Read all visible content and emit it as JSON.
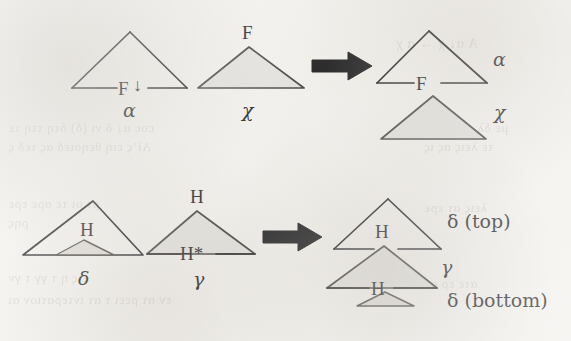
{
  "figure": {
    "kind": "syntactic-tree-triangle-diagram",
    "background_color": "#f2f0ec",
    "ink_color": "#18171a",
    "triangle_fill_color": "#e2e0dc",
    "arrow_color": "#121214",
    "rows": [
      {
        "id": "row-upper",
        "input": {
          "constituents": [
            {
              "id": "alpha-source",
              "filled": false,
              "internal_labels": [
                "F"
              ],
              "internal_label_marker": "downarrow",
              "caption": "α"
            },
            {
              "id": "chi-source",
              "filled": true,
              "apex_labels": [
                "F"
              ],
              "caption": "χ"
            }
          ]
        },
        "operator": "arrow-right",
        "output": {
          "constituents": [
            {
              "id": "alpha-result",
              "filled": false,
              "internal_labels": [
                "F"
              ],
              "side_label": "α"
            },
            {
              "id": "chi-result",
              "filled": true,
              "side_label": "χ"
            }
          ]
        }
      },
      {
        "id": "row-lower",
        "input": {
          "constituents": [
            {
              "id": "delta-source",
              "filled": false,
              "internal_labels": [
                "H"
              ],
              "nested": {
                "id": "delta-source-inner",
                "filled": true
              },
              "caption": "δ"
            },
            {
              "id": "gamma-source",
              "filled": true,
              "apex_labels": [
                "H"
              ],
              "internal_labels": [
                "H*"
              ],
              "caption": "γ"
            }
          ]
        },
        "operator": "arrow-right",
        "output": {
          "constituents": [
            {
              "id": "delta-top-result",
              "filled": false,
              "internal_labels": [
                "H"
              ],
              "side_label": "δ (top)"
            },
            {
              "id": "gamma-result",
              "filled": true,
              "internal_labels": [
                "H"
              ],
              "side_label": "γ"
            },
            {
              "id": "delta-bottom-result",
              "filled": true,
              "side_label": "δ (bottom)"
            }
          ]
        }
      }
    ],
    "labels": {
      "f_upper_left": "F",
      "f_chi_apex": "F",
      "f_result": "F",
      "alpha_caption": "α",
      "chi_caption": "χ",
      "alpha_side": "α",
      "chi_side": "χ",
      "h_delta": "H",
      "h_gamma_apex": "H",
      "h_star_gamma": "H*",
      "delta_caption": "δ",
      "gamma_caption": "γ",
      "h_delta_top_result": "H",
      "h_gamma_result": "H",
      "delta_top_side": "δ (top)",
      "gamma_side": "γ",
      "delta_bottom_side": "δ (bottom)",
      "down_arrow": "↓"
    }
  },
  "bleedthrough": {
    "note": "faint mirrored text showing through from the reverse page",
    "lines": [
      {
        "text": "A  α↓  χ  →  α  χ",
        "x": 396,
        "y": 36,
        "size": 14
      },
      {
        "text": "coc α↓ δ νι (δ) δτη ττη τε",
        "x": 8,
        "y": 120,
        "size": 13
      },
      {
        "text": "Ai’ς ειη θεηοιεδ ας τεδ ς",
        "x": 8,
        "y": 139,
        "size": 13
      },
      {
        "text": "με δλ οι τες δε",
        "x": 424,
        "y": 120,
        "size": 13
      },
      {
        "text": "τε λεις ας ις",
        "x": 424,
        "y": 139,
        "size": 13
      },
      {
        "text": "ρτ οι τε αρε ερε",
        "x": 8,
        "y": 196,
        "size": 13
      },
      {
        "text": "ρης",
        "x": 8,
        "y": 215,
        "size": 13
      },
      {
        "text": "λεις ατ ερε",
        "x": 424,
        "y": 200,
        "size": 13
      },
      {
        "text": "εις η τ γγ τ γν",
        "x": 8,
        "y": 270,
        "size": 13
      },
      {
        "text": "εν ατ ρεει τ ατ ιντερατιον αι",
        "x": 8,
        "y": 292,
        "size": 13
      },
      {
        "text": "ατε ερ ατ",
        "x": 424,
        "y": 276,
        "size": 13
      }
    ]
  }
}
